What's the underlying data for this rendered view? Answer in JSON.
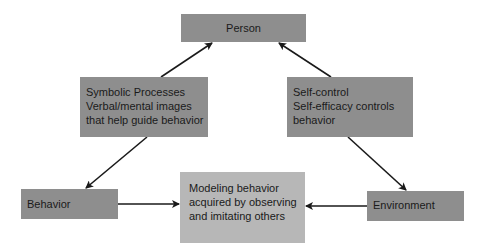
{
  "diagram": {
    "colors": {
      "box_dark": "#8e8e8e",
      "box_light": "#b7b7b7",
      "arrow": "#1a1a1a",
      "text": "#1a1a1a"
    },
    "nodes": {
      "person": {
        "label": "Person"
      },
      "symbolic": {
        "lines": [
          "Symbolic Processes",
          "Verbal/mental images",
          "that help guide behavior"
        ]
      },
      "self_control": {
        "lines": [
          "Self-control",
          "Self-efficacy controls",
          "behavior"
        ]
      },
      "behavior": {
        "label": "Behavior"
      },
      "modeling": {
        "lines": [
          "Modeling behavior",
          "acquired by observing",
          "and imitating others"
        ]
      },
      "environment": {
        "label": "Environment"
      }
    },
    "edges": [
      {
        "from": "symbolic",
        "to": "person"
      },
      {
        "from": "self_control",
        "to": "person"
      },
      {
        "from": "symbolic",
        "to": "behavior"
      },
      {
        "from": "self_control",
        "to": "environment"
      },
      {
        "from": "behavior",
        "to": "modeling"
      },
      {
        "from": "environment",
        "to": "modeling"
      }
    ]
  }
}
